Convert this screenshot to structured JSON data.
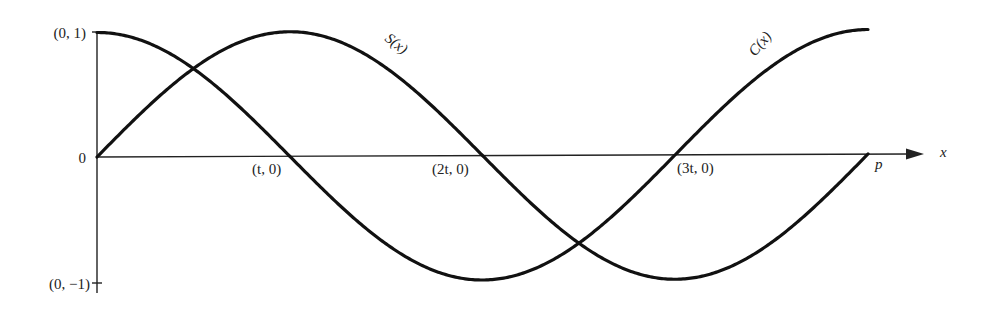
{
  "figure": {
    "curves": [
      {
        "name": "S",
        "label": "S(x)",
        "description": "sine-like curve starting at origin"
      },
      {
        "name": "C",
        "label": "C(x)",
        "description": "cosine-like curve starting at (0, 1)"
      }
    ],
    "axis_labels": {
      "x_axis": "x",
      "y_top": "(0, 1)",
      "y_origin": "0",
      "y_bottom": "(0, −1)"
    },
    "x_ticks": [
      {
        "label": "(t, 0)",
        "value": "t"
      },
      {
        "label": "(2t, 0)",
        "value": "2t"
      },
      {
        "label": "(3t, 0)",
        "value": "3t"
      }
    ],
    "endpoint_label": "p",
    "colors": {
      "ink": "#111111",
      "background": "#ffffff"
    }
  },
  "chart_data": {
    "type": "line",
    "title": "",
    "xlabel": "x",
    "ylabel": "",
    "x": [
      0,
      0.5,
      1,
      1.5,
      2,
      2.5,
      3,
      3.5,
      4
    ],
    "x_units": "multiples of t; p = 4t",
    "series": [
      {
        "name": "S(x)",
        "values": [
          0,
          0.707,
          1,
          0.707,
          0,
          -0.707,
          -1,
          -0.707,
          0
        ]
      },
      {
        "name": "C(x)",
        "values": [
          1,
          0.707,
          0,
          -0.707,
          -1,
          -0.707,
          0,
          0.707,
          1
        ]
      }
    ],
    "ylim": [
      -1,
      1
    ],
    "grid": false,
    "legend": "inline labels on curves"
  }
}
